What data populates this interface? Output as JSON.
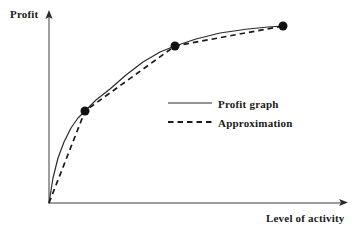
{
  "axes": {
    "y_label": "Profit",
    "x_label": "Level of activity",
    "color": "#3c3c3c",
    "origin": [
      49,
      203
    ],
    "y_axis_top": 11,
    "x_axis_right": 348
  },
  "legend": {
    "entries": [
      {
        "label": "Profit graph",
        "style": "solid"
      },
      {
        "label": "Approximation",
        "style": "dashed"
      }
    ]
  },
  "chart_data": {
    "type": "line",
    "title": "",
    "xlabel": "Level of activity",
    "ylabel": "Profit",
    "grid": false,
    "axis_ticks": false,
    "legend_position": "center-right",
    "series": [
      {
        "name": "Profit graph",
        "style": "solid",
        "color": "#2b2b2b",
        "description": "Smooth concave increasing curve of diminishing returns rising from the origin",
        "points": [
          [
            49,
            203
          ],
          [
            53,
            178
          ],
          [
            58,
            158
          ],
          [
            64,
            142
          ],
          [
            71,
            128
          ],
          [
            78,
            118
          ],
          [
            85,
            111
          ],
          [
            96,
            100
          ],
          [
            110,
            89
          ],
          [
            126,
            75
          ],
          [
            143,
            62
          ],
          [
            160,
            52
          ],
          [
            175,
            46
          ],
          [
            196,
            39
          ],
          [
            220,
            33
          ],
          [
            248,
            29
          ],
          [
            268,
            27
          ],
          [
            283,
            26
          ]
        ]
      },
      {
        "name": "Approximation",
        "style": "dashed",
        "color": "#1a1a1a",
        "description": "Piecewise-linear chords joining the origin and the three marked points",
        "points": [
          [
            49,
            203
          ],
          [
            85,
            111
          ],
          [
            175,
            46
          ],
          [
            283,
            26
          ]
        ]
      }
    ],
    "markers": {
      "name": "knot points",
      "shape": "filled-circle",
      "color": "#111111",
      "radius": 4.5,
      "points": [
        [
          85,
          111
        ],
        [
          175,
          46
        ],
        [
          283,
          26
        ]
      ]
    }
  }
}
